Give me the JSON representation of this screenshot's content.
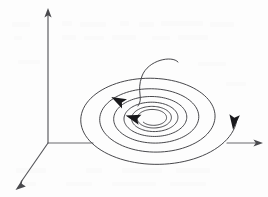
{
  "figure": {
    "caption": "",
    "background_color": "#fdfdfd",
    "stroke_color": "#3d3d41",
    "axis_color": "#58585c",
    "arrow_color": "#19191c",
    "width": 268,
    "height": 197
  },
  "axes": {
    "origin": {
      "x": 48,
      "y": 143
    },
    "items": [
      {
        "name": "vertical-axis",
        "label": "",
        "from": {
          "x": 48,
          "y": 143
        },
        "to": {
          "x": 48,
          "y": 11
        },
        "arrow": true,
        "arrow_direction": "up"
      },
      {
        "name": "depth-axis",
        "label": "",
        "from": {
          "x": 48,
          "y": 143
        },
        "to": {
          "x": 18,
          "y": 186
        },
        "arrow": true,
        "arrow_direction": "down-left"
      },
      {
        "name": "horizontal-axis-left-stub",
        "label": "",
        "from": {
          "x": 48,
          "y": 143
        },
        "to": {
          "x": 92,
          "y": 143
        },
        "arrow": false,
        "arrow_direction": ""
      },
      {
        "name": "horizontal-axis-right-stub",
        "label": "",
        "from": {
          "x": 228,
          "y": 143
        },
        "to": {
          "x": 262,
          "y": 143
        },
        "arrow": true,
        "arrow_direction": "right"
      }
    ]
  },
  "chart_data": {
    "type": "line",
    "title": "",
    "xlabel": "",
    "ylabel": "",
    "grid": false,
    "legend": "none",
    "projection": {
      "center_x": 153,
      "center_y": 118,
      "squash_ratio": 0.6
    },
    "spiral": {
      "turns": 6.4,
      "start_radius_x": 84,
      "start_radius_y": 50,
      "end_radius_x": 12,
      "end_radius_y": 7,
      "direction": "clockwise-inward",
      "start_angle_deg": 0
    },
    "incoming_trajectory": {
      "from": {
        "x": 178,
        "y": 62
      },
      "peak": {
        "x": 162,
        "y": 58
      },
      "to": {
        "x": 138,
        "y": 106
      },
      "description": "descending approach curve joining the outer spiral"
    },
    "flow_arrows": [
      {
        "name": "inner-flow-arrow",
        "x": 119,
        "y": 101,
        "angle_deg": 208
      },
      {
        "name": "mid-flow-arrow",
        "x": 134,
        "y": 118,
        "angle_deg": 196
      },
      {
        "name": "outer-flow-arrow",
        "x": 234,
        "y": 121,
        "angle_deg": 96
      }
    ]
  }
}
